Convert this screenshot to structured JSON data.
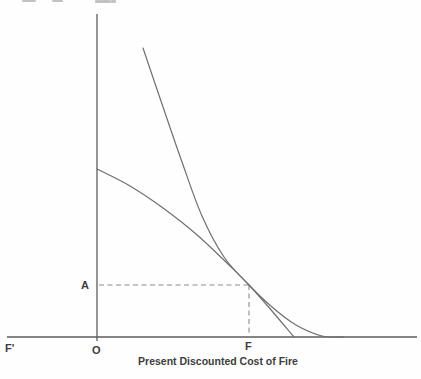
{
  "figure": {
    "x_axis_title": "Present Discounted Cost of Fire",
    "labels": {
      "point_a": "A",
      "f_prime": "F'",
      "origin": "O",
      "point_f": "F"
    }
  },
  "chart_data": {
    "type": "line",
    "title": "",
    "xlabel": "Present Discounted Cost of Fire",
    "ylabel": "",
    "note": "Economics tangency diagram; no numeric scale shown. Coordinates are figure pixel positions (y increases downward). Two curves are tangent above point F; dashed guides mark level A on the vertical axis and point F on the horizontal axis.",
    "landmarks": {
      "origin_label": "O",
      "x_axis_left_label": "F'",
      "x_axis_point_label": "F",
      "y_axis_point_label": "A",
      "tangency_px": [
        249,
        285
      ]
    },
    "axes_px": {
      "y_axis": {
        "x": 97,
        "y1": 14,
        "y2": 341
      },
      "x_axis": {
        "y": 337,
        "x1": 7,
        "x2": 417
      }
    },
    "series": [
      {
        "name": "convex-steep-curve",
        "points_px": [
          [
            143,
            48
          ],
          [
            162,
            104
          ],
          [
            182,
            162
          ],
          [
            202,
            216
          ],
          [
            224,
            257
          ],
          [
            249,
            285
          ],
          [
            272,
            307
          ],
          [
            296,
            325
          ],
          [
            322,
            336
          ],
          [
            344,
            337
          ]
        ]
      },
      {
        "name": "tangent-gentle-curve",
        "points_px": [
          [
            97,
            169
          ],
          [
            130,
            186
          ],
          [
            163,
            208
          ],
          [
            196,
            234
          ],
          [
            229,
            265
          ],
          [
            249,
            285
          ],
          [
            272,
            311
          ],
          [
            294,
            337
          ]
        ]
      }
    ],
    "dashed_guides": [
      {
        "name": "horizontal-guide-A",
        "from": [
          99,
          285
        ],
        "to": [
          249,
          285
        ]
      },
      {
        "name": "vertical-guide-F",
        "from": [
          249,
          285
        ],
        "to": [
          249,
          336
        ]
      }
    ],
    "colors": {
      "axis": "#5c5c5c",
      "curve": "#6f6f6f",
      "dashed": "#8a8a8a",
      "label": "#3d3d3d"
    }
  },
  "artifacts": {
    "top_cropped_text_marks_px": [
      [
        22,
        0,
        14,
        2
      ],
      [
        52,
        0,
        11,
        2
      ],
      [
        95,
        0,
        16,
        3
      ],
      [
        111,
        0,
        5,
        3
      ]
    ]
  }
}
